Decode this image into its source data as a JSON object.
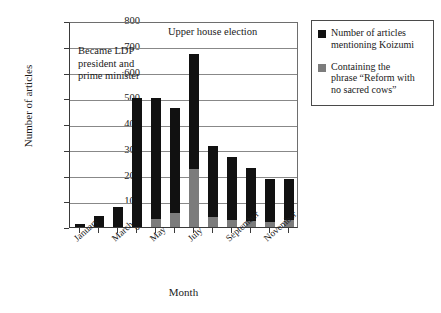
{
  "chart_data": {
    "type": "bar",
    "subtype": "stacked-bar",
    "title": "",
    "xlabel": "Month",
    "ylabel": "Number of articles",
    "ylim": [
      0,
      800
    ],
    "ytick_step": 100,
    "yticks": [
      "800",
      "700",
      "600",
      "500",
      "400",
      "300",
      "200",
      "100",
      "0"
    ],
    "grid": true,
    "legend_position": "right-outside",
    "categories": [
      "January",
      "February",
      "March",
      "April",
      "May",
      "June",
      "July",
      "August",
      "September",
      "October",
      "November",
      "December"
    ],
    "tick_labels_shown": [
      "January",
      "March",
      "May",
      "July",
      "September",
      "November"
    ],
    "series": [
      {
        "name": "Number of articles mentioning Koizumi",
        "color": "#111111",
        "values": [
          13,
          42,
          78,
          500,
          500,
          462,
          672,
          313,
          271,
          228,
          186,
          185
        ]
      },
      {
        "name": "Containing the phrase “Reform with no sacred cows”",
        "color": "#7c7c7c",
        "values": [
          0,
          0,
          0,
          0,
          30,
          55,
          225,
          38,
          26,
          22,
          20,
          28
        ]
      }
    ],
    "annotations": [
      {
        "text": "Became LDP\npresident and\nprime minister"
      },
      {
        "text": "Upper house election"
      }
    ]
  },
  "legend": {
    "items": [
      {
        "label": "Number of articles\nmentioning Koizumi",
        "swatch": "black-square-swatch"
      },
      {
        "label": "Containing the\nphrase “Reform with\nno sacred cows”",
        "swatch": "grey-square-swatch"
      }
    ]
  }
}
